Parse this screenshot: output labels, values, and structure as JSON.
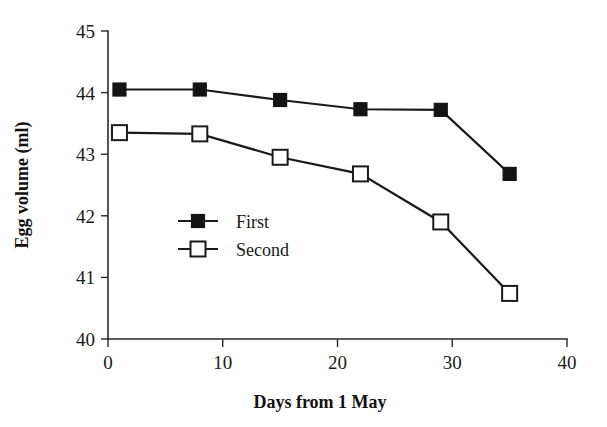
{
  "chart_data": {
    "type": "line",
    "title": "",
    "xlabel": "Days from 1 May",
    "ylabel": "Egg volume (ml)",
    "xlim": [
      0,
      40
    ],
    "ylim": [
      40,
      45
    ],
    "xticks": [
      0,
      10,
      20,
      30,
      40
    ],
    "yticks": [
      40,
      41,
      42,
      43,
      44,
      45
    ],
    "xtick_labels": [
      "0",
      "10",
      "20",
      "30",
      "40"
    ],
    "ytick_labels": [
      "40",
      "41",
      "42",
      "43",
      "44",
      "45"
    ],
    "grid": false,
    "legend_position": "center-left-inside",
    "x": [
      1,
      8,
      15,
      22,
      29,
      35
    ],
    "series": [
      {
        "name": "First",
        "marker": "filled-square",
        "color": "#141414",
        "values": [
          44.05,
          44.05,
          43.88,
          43.73,
          43.72,
          42.68
        ]
      },
      {
        "name": "Second",
        "marker": "open-square",
        "color": "#1a1a1a",
        "values": [
          43.35,
          43.33,
          42.95,
          42.68,
          41.9,
          40.74
        ]
      }
    ]
  },
  "legend": {
    "items": [
      {
        "label": "First"
      },
      {
        "label": "Second"
      }
    ]
  },
  "axes": {
    "x_title": "Days from 1 May",
    "y_title": "Egg volume (ml)"
  }
}
